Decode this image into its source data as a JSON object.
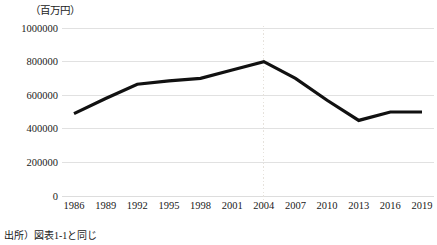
{
  "figure": {
    "unit_label": "（百万円）",
    "source_note": "出所）図表1-1と同じ"
  },
  "chart_data": {
    "type": "line",
    "title": "",
    "subtitle": "",
    "xlabel": "",
    "ylabel": "",
    "unit": "百万円",
    "categories": [
      "1986",
      "1989",
      "1992",
      "1995",
      "1998",
      "2001",
      "2004",
      "2007",
      "2010",
      "2013",
      "2016",
      "2019"
    ],
    "values": [
      490000,
      580000,
      665000,
      685000,
      700000,
      750000,
      800000,
      700000,
      570000,
      450000,
      500000,
      500000
    ],
    "series": [
      {
        "name": "",
        "color": "#111111",
        "values": [
          490000,
          580000,
          665000,
          685000,
          700000,
          750000,
          800000,
          700000,
          570000,
          450000,
          500000,
          500000
        ]
      }
    ],
    "ylim": [
      0,
      1000000
    ],
    "yticks": [
      0,
      200000,
      400000,
      600000,
      800000,
      1000000
    ],
    "ytick_labels": [
      "0",
      "200000",
      "400000",
      "600000",
      "800000",
      "1000000"
    ],
    "grid": true,
    "grid_axis": "y",
    "grid_color": "#d9d9d9",
    "legend": false,
    "legend_position": "none",
    "annotations": [
      {
        "type": "vertical-dotted-line",
        "at_category": "2004",
        "color": "#e6e2dc",
        "style": "dotted"
      }
    ]
  }
}
